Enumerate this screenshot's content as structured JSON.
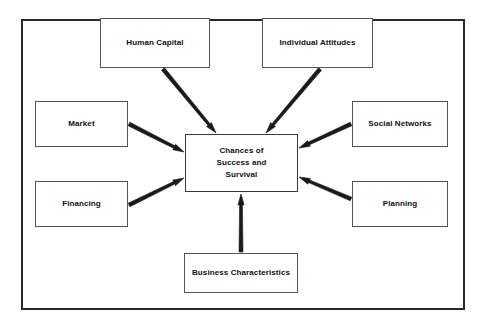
{
  "diagram": {
    "frame": {
      "border_color": "#2b2b2b"
    },
    "center_node": {
      "id": "chances",
      "label": "Chances of\nSuccess and\nSurvival",
      "x": 185,
      "y": 134,
      "width": 113,
      "height": 58
    },
    "nodes": [
      {
        "id": "human-capital",
        "label": "Human Capital",
        "x": 100,
        "y": 18,
        "width": 110,
        "height": 50
      },
      {
        "id": "individual-attitudes",
        "label": "Individual Attitudes",
        "x": 262,
        "y": 18,
        "width": 111,
        "height": 50
      },
      {
        "id": "market",
        "label": "Market",
        "x": 35,
        "y": 101,
        "width": 93,
        "height": 46
      },
      {
        "id": "social-networks",
        "label": "Social Networks",
        "x": 352,
        "y": 101,
        "width": 96,
        "height": 46
      },
      {
        "id": "financing",
        "label": "Financing",
        "x": 35,
        "y": 181,
        "width": 93,
        "height": 46
      },
      {
        "id": "planning",
        "label": "Planning",
        "x": 352,
        "y": 181,
        "width": 96,
        "height": 46
      },
      {
        "id": "business-characteristics",
        "label": "Business Characteristics",
        "x": 184,
        "y": 253,
        "width": 114,
        "height": 40
      }
    ],
    "arrows": [
      {
        "id": "arrow-human-capital-to-chances",
        "from": "human-capital",
        "to": "chances",
        "x1": 163,
        "y1": 69,
        "x2": 216,
        "y2": 133,
        "color": "#1a1a1a"
      },
      {
        "id": "arrow-individual-attitudes-to-chances",
        "from": "individual-attitudes",
        "to": "chances",
        "x1": 320,
        "y1": 69,
        "x2": 266,
        "y2": 133,
        "color": "#1a1a1a"
      },
      {
        "id": "arrow-market-to-chances",
        "from": "market",
        "to": "chances",
        "x1": 129,
        "y1": 124,
        "x2": 184,
        "y2": 152,
        "color": "#1a1a1a"
      },
      {
        "id": "arrow-social-networks-to-chances",
        "from": "social-networks",
        "to": "chances",
        "x1": 351,
        "y1": 124,
        "x2": 299,
        "y2": 148,
        "color": "#1a1a1a"
      },
      {
        "id": "arrow-financing-to-chances",
        "from": "financing",
        "to": "chances",
        "x1": 129,
        "y1": 205,
        "x2": 184,
        "y2": 178,
        "color": "#1a1a1a"
      },
      {
        "id": "arrow-planning-to-chances",
        "from": "planning",
        "to": "chances",
        "x1": 351,
        "y1": 199,
        "x2": 299,
        "y2": 177,
        "color": "#1a1a1a"
      },
      {
        "id": "arrow-business-characteristics-to-chances",
        "from": "business-characteristics",
        "to": "chances",
        "x1": 241,
        "y1": 252,
        "x2": 241,
        "y2": 194,
        "color": "#1a1a1a"
      }
    ]
  }
}
